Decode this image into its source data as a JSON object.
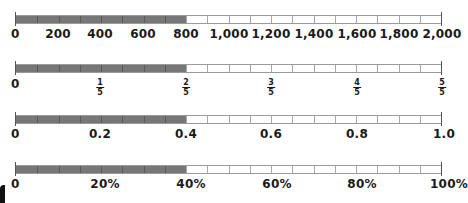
{
  "chart_data": [
    {
      "type": "number_line_bar",
      "title": "",
      "scale": "whole numbers",
      "min": 0,
      "max": 2000,
      "shaded_to": 800,
      "segments": 20,
      "tick_labels": [
        "0",
        "200",
        "400",
        "600",
        "800",
        "1,000",
        "1,200",
        "1,400",
        "1,600",
        "1,800",
        "2,000"
      ]
    },
    {
      "type": "number_line_bar",
      "scale": "fifths",
      "min": 0,
      "max": 1,
      "shaded_to": 0.4,
      "segments": 20,
      "tick_labels": [
        {
          "text": "0"
        },
        {
          "num": "1",
          "den": "5"
        },
        {
          "num": "2",
          "den": "5"
        },
        {
          "num": "3",
          "den": "5"
        },
        {
          "num": "4",
          "den": "5"
        },
        {
          "num": "5",
          "den": "5"
        }
      ]
    },
    {
      "type": "number_line_bar",
      "scale": "decimals",
      "min": 0,
      "max": 1.0,
      "shaded_to": 0.4,
      "segments": 20,
      "tick_labels": [
        "0",
        "0.2",
        "0.4",
        "0.6",
        "0.8",
        "1.0"
      ]
    },
    {
      "type": "number_line_bar",
      "scale": "percent",
      "min": 0,
      "max": 100,
      "shaded_to": 40,
      "segments": 20,
      "tick_labels": [
        "0",
        "20%",
        "40%",
        "60%",
        "80%",
        "100%"
      ]
    }
  ],
  "colors": {
    "shaded": "#777777",
    "unshaded": "#ffffff",
    "border": "#9a9a9a"
  },
  "lines": {
    "whole": {
      "labels": [
        "0",
        "200",
        "400",
        "600",
        "800",
        "1,000",
        "1,200",
        "1,400",
        "1,600",
        "1,800",
        "2,000"
      ]
    },
    "fractions": {
      "zero": "0",
      "fracs": [
        {
          "num": "1",
          "den": "5"
        },
        {
          "num": "2",
          "den": "5"
        },
        {
          "num": "3",
          "den": "5"
        },
        {
          "num": "4",
          "den": "5"
        },
        {
          "num": "5",
          "den": "5"
        }
      ]
    },
    "decimals": {
      "labels": [
        "0",
        "0.2",
        "0.4",
        "0.6",
        "0.8",
        "1.0"
      ]
    },
    "percents": {
      "labels": [
        "0",
        "20%",
        "40%",
        "60%",
        "80%",
        "100%"
      ]
    }
  }
}
